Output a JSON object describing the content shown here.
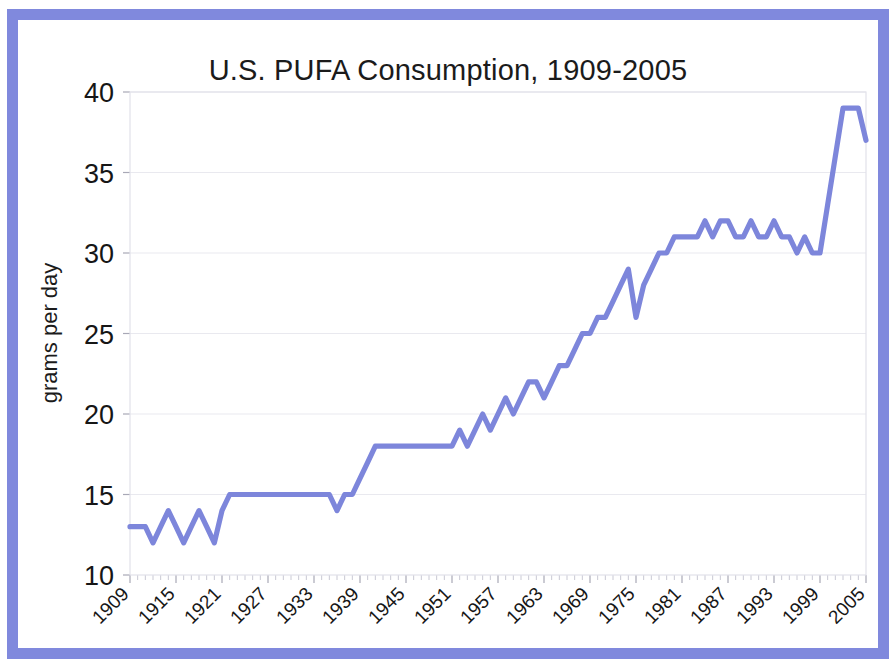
{
  "figure": {
    "border_color": "#8089dd",
    "background": "#ffffff"
  },
  "chart_data": {
    "type": "line",
    "title": "U.S. PUFA Consumption, 1909-2005",
    "xlabel": "",
    "ylabel": "grams per day",
    "xlim": [
      1909,
      2005
    ],
    "ylim": [
      10,
      40
    ],
    "yticks": [
      10,
      15,
      20,
      25,
      30,
      35,
      40
    ],
    "ytick_labels": [
      "10",
      "15",
      "20",
      "25",
      "30",
      "35",
      "40"
    ],
    "xticks": [
      1909,
      1915,
      1921,
      1927,
      1933,
      1939,
      1945,
      1951,
      1957,
      1963,
      1969,
      1975,
      1981,
      1987,
      1993,
      1999,
      2005
    ],
    "xtick_labels": [
      "1909",
      "1915",
      "1921",
      "1927",
      "1933",
      "1939",
      "1945",
      "1951",
      "1957",
      "1963",
      "1969",
      "1975",
      "1981",
      "1987",
      "1993",
      "1999",
      "2005"
    ],
    "xtick_rotation": -45,
    "grid": true,
    "grid_axis": "y",
    "legend": false,
    "line_color": "#7d86db",
    "line_width": 5.2,
    "series": [
      {
        "name": "U.S. PUFA consumption",
        "units": "grams per day",
        "x": [
          1909,
          1910,
          1911,
          1912,
          1913,
          1914,
          1915,
          1916,
          1917,
          1918,
          1919,
          1920,
          1921,
          1922,
          1923,
          1924,
          1925,
          1926,
          1927,
          1928,
          1929,
          1930,
          1931,
          1932,
          1933,
          1934,
          1935,
          1936,
          1937,
          1938,
          1939,
          1940,
          1941,
          1942,
          1943,
          1944,
          1945,
          1946,
          1947,
          1948,
          1949,
          1950,
          1951,
          1952,
          1953,
          1954,
          1955,
          1956,
          1957,
          1958,
          1959,
          1960,
          1961,
          1962,
          1963,
          1964,
          1965,
          1966,
          1967,
          1968,
          1969,
          1970,
          1971,
          1972,
          1973,
          1974,
          1975,
          1976,
          1977,
          1978,
          1979,
          1980,
          1981,
          1982,
          1983,
          1984,
          1985,
          1986,
          1987,
          1988,
          1989,
          1990,
          1991,
          1992,
          1993,
          1994,
          1995,
          1996,
          1997,
          1998,
          1999,
          2000,
          2001,
          2002,
          2003,
          2004,
          2005
        ],
        "y": [
          13,
          13,
          13,
          12,
          13,
          14,
          13,
          12,
          13,
          14,
          13,
          12,
          14,
          15,
          15,
          15,
          15,
          15,
          15,
          15,
          15,
          15,
          15,
          15,
          15,
          15,
          15,
          14,
          15,
          15,
          16,
          17,
          18,
          18,
          18,
          18,
          18,
          18,
          18,
          18,
          18,
          18,
          18,
          19,
          18,
          19,
          20,
          19,
          20,
          21,
          20,
          21,
          22,
          22,
          21,
          22,
          23,
          23,
          24,
          25,
          25,
          26,
          26,
          27,
          28,
          29,
          26,
          28,
          29,
          30,
          30,
          31,
          31,
          31,
          31,
          32,
          31,
          32,
          32,
          31,
          31,
          32,
          31,
          31,
          32,
          31,
          31,
          30,
          31,
          30,
          30,
          33,
          36,
          39,
          39,
          39,
          37
        ]
      }
    ]
  },
  "tick_marks": {
    "minor_interval_years": 1,
    "major_interval_years": 6
  }
}
